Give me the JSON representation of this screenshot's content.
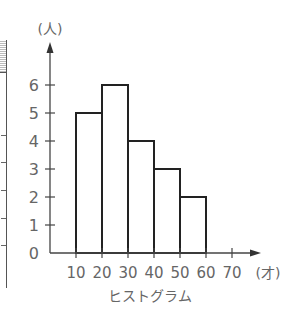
{
  "chart_data": {
    "type": "bar",
    "subtype": "histogram",
    "title": "ヒストグラム",
    "xlabel": "(才)",
    "ylabel": "(人)",
    "bin_edges": [
      10,
      20,
      30,
      40,
      50,
      60
    ],
    "categories": [
      "10-20",
      "20-30",
      "30-40",
      "40-50",
      "50-60"
    ],
    "values": [
      5,
      6,
      4,
      3,
      2
    ],
    "x_tick_labels": [
      "10",
      "20",
      "30",
      "40",
      "50",
      "60",
      "70"
    ],
    "y_tick_labels": [
      "0",
      "1",
      "2",
      "3",
      "4",
      "5",
      "6"
    ],
    "xlim": [
      0,
      70
    ],
    "ylim": [
      0,
      6
    ],
    "grid": false,
    "legend": null,
    "bar_fill": "#ffffff",
    "bar_stroke": "#222222"
  },
  "labels": {
    "y_unit": "(人)",
    "x_unit": "(才)",
    "caption": "ヒストグラム"
  }
}
